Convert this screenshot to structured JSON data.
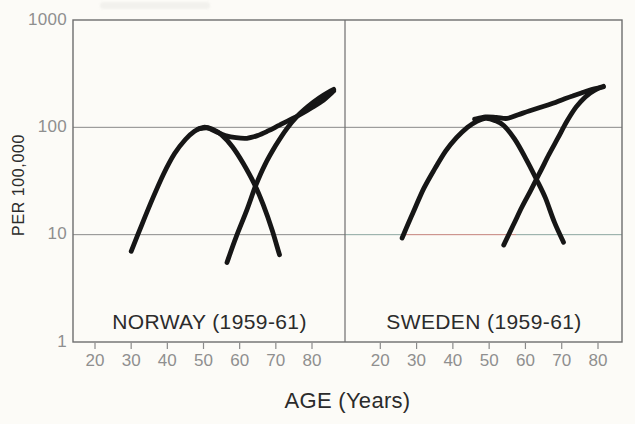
{
  "page": {
    "background": "#fcfbf7"
  },
  "figure": {
    "y_axis": {
      "label": "PER 100,000",
      "tick_labels": [
        "1000",
        "100",
        "10",
        "1"
      ]
    },
    "x_axis": {
      "label": "AGE (Years)",
      "tick_labels": [
        "20",
        "30",
        "40",
        "50",
        "60",
        "70",
        "80"
      ]
    },
    "panels": [
      {
        "title": "NORWAY (1959-61)"
      },
      {
        "title": "SWEDEN (1959-61)"
      }
    ],
    "colors": {
      "background": "#fcfbf7",
      "curve": "#161616",
      "grid": "#8a8a8a",
      "frame": "#6e6e6e",
      "tick_text": "#8f8f8f",
      "title_text": "#2b2b2b",
      "artifact_red": "#c4827c",
      "artifact_teal": "#8da6a1"
    }
  },
  "chart_data": [
    {
      "type": "line",
      "id": "norway",
      "title": "NORWAY (1959-61)",
      "xlabel": "AGE (Years)",
      "ylabel": "PER 100,000",
      "y_scale": "log",
      "ylim": [
        1,
        1000
      ],
      "x_ticks": [
        20,
        30,
        40,
        50,
        60,
        70,
        80
      ],
      "y_gridlines": [
        10,
        100
      ],
      "grid": true,
      "legend": "none",
      "series": [
        {
          "id": "total",
          "name": "total (all ages rise)",
          "points": [
            [
              48.5,
              96
            ],
            [
              51,
              99
            ],
            [
              53.5,
              91
            ],
            [
              56,
              84
            ],
            [
              59,
              80
            ],
            [
              62,
              79
            ],
            [
              65,
              84
            ],
            [
              68,
              93
            ],
            [
              71,
              105
            ],
            [
              74,
              118
            ],
            [
              77,
              133
            ],
            [
              80,
              153
            ],
            [
              83,
              178
            ],
            [
              86,
              218
            ]
          ]
        },
        {
          "id": "early",
          "name": "early-age component (peaks ~age 50 at ~100)",
          "points": [
            [
              30,
              7
            ],
            [
              33,
              12.5
            ],
            [
              36,
              22
            ],
            [
              39,
              37
            ],
            [
              42,
              57
            ],
            [
              45,
              77
            ],
            [
              47.5,
              92
            ],
            [
              50,
              100
            ],
            [
              52.5,
              96
            ],
            [
              55,
              85
            ],
            [
              58,
              66
            ],
            [
              61,
              46
            ],
            [
              64,
              30
            ],
            [
              66.5,
              19
            ],
            [
              69,
              11
            ],
            [
              71,
              6.5
            ]
          ]
        },
        {
          "id": "late",
          "name": "late-age component (rises from ~age 56)",
          "points": [
            [
              56.5,
              5.5
            ],
            [
              59,
              9.5
            ],
            [
              62,
              17
            ],
            [
              64.5,
              29
            ],
            [
              67,
              45
            ],
            [
              70,
              68
            ],
            [
              73,
              97
            ],
            [
              76,
              128
            ],
            [
              79,
              158
            ],
            [
              82,
              188
            ],
            [
              84.5,
              212
            ],
            [
              86,
              226
            ]
          ]
        }
      ]
    },
    {
      "type": "line",
      "id": "sweden",
      "title": "SWEDEN (1959-61)",
      "xlabel": "AGE (Years)",
      "ylabel": "PER 100,000",
      "y_scale": "log",
      "ylim": [
        1,
        1000
      ],
      "x_ticks": [
        20,
        30,
        40,
        50,
        60,
        70,
        80
      ],
      "y_gridlines": [
        10,
        100
      ],
      "grid": true,
      "legend": "none",
      "series": [
        {
          "id": "total",
          "name": "total (all ages rise)",
          "points": [
            [
              46,
              119
            ],
            [
              49,
              125
            ],
            [
              52,
              124
            ],
            [
              55,
              121
            ],
            [
              58,
              131
            ],
            [
              61,
              142
            ],
            [
              64,
              153
            ],
            [
              67,
              165
            ],
            [
              70,
              180
            ],
            [
              73,
              196
            ],
            [
              76,
              212
            ],
            [
              79,
              228
            ],
            [
              81.5,
              238
            ]
          ]
        },
        {
          "id": "early",
          "name": "early-age component (peaks ~age 49 at ~120)",
          "points": [
            [
              26,
              9.3
            ],
            [
              29,
              16
            ],
            [
              32,
              27
            ],
            [
              35,
              41
            ],
            [
              38,
              60
            ],
            [
              41,
              80
            ],
            [
              44,
              100
            ],
            [
              46.5,
              113
            ],
            [
              49,
              121
            ],
            [
              51.5,
              116
            ],
            [
              54,
              104
            ],
            [
              57,
              78
            ],
            [
              60,
              52
            ],
            [
              63,
              33
            ],
            [
              65.5,
              22
            ],
            [
              68,
              13
            ],
            [
              70.5,
              8.5
            ]
          ]
        },
        {
          "id": "late",
          "name": "late-age component (rises from ~age 54)",
          "points": [
            [
              54,
              8
            ],
            [
              56.5,
              12
            ],
            [
              59,
              18
            ],
            [
              61.5,
              26
            ],
            [
              64,
              38
            ],
            [
              66.5,
              56
            ],
            [
              69,
              80
            ],
            [
              71.5,
              115
            ],
            [
              74,
              155
            ],
            [
              76.5,
              192
            ],
            [
              79,
              221
            ],
            [
              81.5,
              241
            ]
          ]
        }
      ]
    }
  ]
}
